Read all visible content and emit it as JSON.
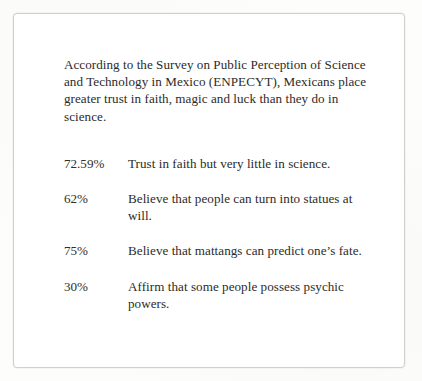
{
  "document": {
    "intro_paragraph": "According to the Survey on Public Perception of Science and Technology in Mexico (ENPECYT), Mexicans place greater trust in faith, magic and luck than they do in science.",
    "statistics": [
      {
        "percent": "72.59%",
        "description": "Trust in faith but very little in science."
      },
      {
        "percent": "62%",
        "description": "Believe that people can turn into statues at will."
      },
      {
        "percent": "75%",
        "description": "Believe that mattangs can predict one’s fate."
      },
      {
        "percent": "30%",
        "description": "Affirm that some people possess psychic powers."
      }
    ]
  },
  "colors": {
    "page_background": "#fdfdfb",
    "card_background": "#ffffff",
    "card_border": "#cfcfcf",
    "text": "#2c2b29"
  }
}
